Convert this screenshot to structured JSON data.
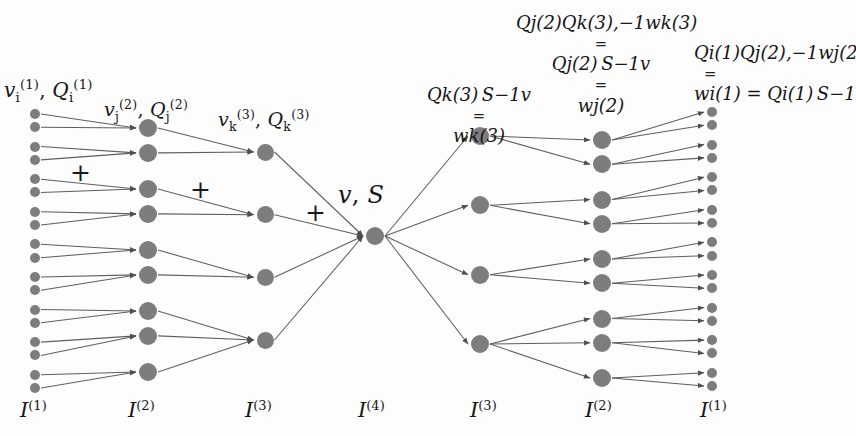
{
  "diagram": {
    "node_color": "#7d7d7d",
    "edge_color": "#5a5a5a",
    "background": "#fdfdfd",
    "columns": [
      {
        "id": "I1-left",
        "label": "I(1)",
        "node_count": 18,
        "x": 35,
        "radius": 5.0
      },
      {
        "id": "I2-left",
        "label": "I(2)",
        "node_count": 9,
        "x": 148,
        "radius": 9.0
      },
      {
        "id": "I3-left",
        "label": "I(3)",
        "node_count": 4,
        "x": 265,
        "radius": 8.5
      },
      {
        "id": "I4-mid",
        "label": "I(4)",
        "node_count": 1,
        "x": 375,
        "radius": 9.0
      },
      {
        "id": "I3-right",
        "label": "I(3)",
        "node_count": 4,
        "x": 480,
        "radius": 9.0
      },
      {
        "id": "I2-right",
        "label": "I(2)",
        "node_count": 9,
        "x": 602,
        "radius": 9.0
      },
      {
        "id": "I1-right",
        "label": "I(1)",
        "node_count": 18,
        "x": 712,
        "radius": 5.0
      }
    ],
    "layer_labels": [
      {
        "name": "layer-label-I1-left",
        "base": "I",
        "sup": "(1)",
        "x": 20,
        "y": 398
      },
      {
        "name": "layer-label-I2-left",
        "base": "I",
        "sup": "(2)",
        "x": 128,
        "y": 398
      },
      {
        "name": "layer-label-I3-left",
        "base": "I",
        "sup": "(3)",
        "x": 245,
        "y": 398
      },
      {
        "name": "layer-label-I4-mid",
        "base": "I",
        "sup": "(4)",
        "x": 358,
        "y": 398
      },
      {
        "name": "layer-label-I3-right",
        "base": "I",
        "sup": "(3)",
        "x": 470,
        "y": 398
      },
      {
        "name": "layer-label-I2-right",
        "base": "I",
        "sup": "(2)",
        "x": 585,
        "y": 398
      },
      {
        "name": "layer-label-I1-right",
        "base": "I",
        "sup": "(1)",
        "x": 700,
        "y": 398
      }
    ],
    "plus_signs": [
      {
        "name": "plus-sign-1",
        "text": "+",
        "x": 70,
        "y": 160
      },
      {
        "name": "plus-sign-2",
        "text": "+",
        "x": 190,
        "y": 177
      },
      {
        "name": "plus-sign-3",
        "text": "+",
        "x": 305,
        "y": 200
      }
    ],
    "annotations": {
      "input_v1Q1": {
        "name": "label-v1-Q1",
        "x": 4,
        "y": 78,
        "size": 20,
        "text": "v_i^(1), Q_i^(1)"
      },
      "input_v2Q2": {
        "name": "label-v2-Q2",
        "x": 104,
        "y": 98,
        "size": 19,
        "text": "v_j^(2), Q_j^(2)"
      },
      "input_v3Q3": {
        "name": "label-v3-Q3",
        "x": 218,
        "y": 108,
        "size": 19,
        "text": "v_k^(3), Q_k^(3)"
      },
      "center_vS": {
        "name": "label-v-S",
        "x": 338,
        "y": 182,
        "size": 23,
        "text": "v, S"
      },
      "out_w3": {
        "name": "label-w3-stack",
        "x": 418,
        "y": 84,
        "size": 18,
        "lines": [
          "Q_k^(3) S^-1 v",
          "=",
          "w_k^(3)"
        ]
      },
      "out_w2": {
        "name": "label-w2-stack",
        "x": 525,
        "y": 12,
        "size": 18,
        "lines": [
          "Q_j^(2) Q_k^(3),-1 w_k^(3)",
          "=",
          "Q_j^(2) S^-1 v",
          "=",
          "w_j^(2)"
        ]
      },
      "out_w1": {
        "name": "label-w1-stack",
        "x": 700,
        "y": 42,
        "size": 18,
        "lines": [
          "Q_i^(1) Q_j^(2),-1 w_j^(2)",
          "=",
          "w_i^(1) = Q_i^(1) S^-1 v"
        ]
      }
    }
  }
}
